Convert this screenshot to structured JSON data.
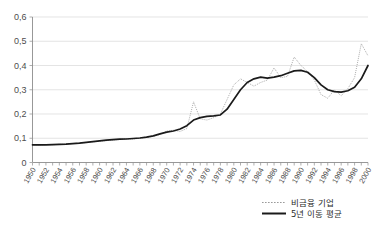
{
  "chart_data": {
    "type": "line",
    "title": "",
    "xlabel": "",
    "ylabel": "",
    "xlim": [
      1950,
      2000
    ],
    "ylim": [
      0,
      0.6
    ],
    "grid": true,
    "legend_position": "bottom-right",
    "y_ticks": [
      "0",
      "0,1",
      "0,2",
      "0,3",
      "0,4",
      "0,5",
      "0,6"
    ],
    "y_tick_values": [
      0,
      0.1,
      0.2,
      0.3,
      0.4,
      0.5,
      0.6
    ],
    "x_tick_labels": [
      "1950",
      "1952",
      "1954",
      "1956",
      "1958",
      "1960",
      "1962",
      "1964",
      "1966",
      "1968",
      "1970",
      "1972",
      "1974",
      "1976",
      "1978",
      "1980",
      "1982",
      "1984",
      "1986",
      "1988",
      "1990",
      "1992",
      "1994",
      "1996",
      "1998",
      "2000"
    ],
    "x": [
      1950,
      1951,
      1952,
      1953,
      1954,
      1955,
      1956,
      1957,
      1958,
      1959,
      1960,
      1961,
      1962,
      1963,
      1964,
      1965,
      1966,
      1967,
      1968,
      1969,
      1970,
      1971,
      1972,
      1973,
      1974,
      1975,
      1976,
      1977,
      1978,
      1979,
      1980,
      1981,
      1982,
      1983,
      1984,
      1985,
      1986,
      1987,
      1988,
      1989,
      1990,
      1991,
      1992,
      1993,
      1994,
      1995,
      1996,
      1997,
      1998,
      1999,
      2000
    ],
    "series": [
      {
        "name": "비금융 기업",
        "style": "dotted",
        "color": "#9a9a9a",
        "values": [
          0.072,
          0.07,
          0.074,
          0.073,
          0.075,
          0.076,
          0.078,
          0.08,
          0.082,
          0.085,
          0.088,
          0.09,
          0.093,
          0.095,
          0.098,
          0.097,
          0.1,
          0.104,
          0.108,
          0.115,
          0.13,
          0.133,
          0.128,
          0.14,
          0.25,
          0.18,
          0.175,
          0.185,
          0.2,
          0.26,
          0.32,
          0.345,
          0.33,
          0.315,
          0.33,
          0.34,
          0.39,
          0.35,
          0.355,
          0.435,
          0.4,
          0.375,
          0.34,
          0.28,
          0.265,
          0.3,
          0.275,
          0.305,
          0.35,
          0.49,
          0.44
        ]
      },
      {
        "name": "5년 이동 평균",
        "style": "solid",
        "color": "#1a1a1a",
        "values": [
          0.073,
          0.073,
          0.073,
          0.074,
          0.075,
          0.076,
          0.078,
          0.08,
          0.083,
          0.086,
          0.089,
          0.092,
          0.094,
          0.096,
          0.097,
          0.099,
          0.101,
          0.105,
          0.11,
          0.118,
          0.125,
          0.13,
          0.138,
          0.152,
          0.175,
          0.185,
          0.19,
          0.192,
          0.196,
          0.22,
          0.26,
          0.3,
          0.33,
          0.345,
          0.352,
          0.348,
          0.352,
          0.358,
          0.368,
          0.378,
          0.38,
          0.372,
          0.35,
          0.32,
          0.3,
          0.292,
          0.29,
          0.296,
          0.31,
          0.345,
          0.4
        ]
      }
    ]
  },
  "legend": {
    "entries": [
      {
        "label": "비금융 기업",
        "marker": "dotted-line-swatch"
      },
      {
        "label": "5년 이동 평균",
        "marker": "solid-line-swatch"
      }
    ]
  }
}
